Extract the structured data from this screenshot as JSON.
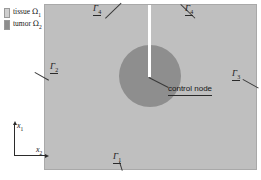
{
  "figure": {
    "colors": {
      "tissue_fill": "#bfbfbf",
      "tumor_fill": "#8e8e8e",
      "probe": "#ffffff",
      "line": "#2a2a2a",
      "background": "#ffffff"
    }
  },
  "legend": {
    "items": [
      {
        "label": "tissue",
        "symbol": "Ω",
        "subscript": "1",
        "swatch_color": "#cfcfcf",
        "name": "tissue"
      },
      {
        "label": "tumor",
        "symbol": "Ω",
        "subscript": "2",
        "swatch_color": "#8e8e8e",
        "name": "tumor"
      }
    ]
  },
  "boundaries": [
    {
      "id": "gamma-1",
      "symbol": "Γ",
      "subscript": "1",
      "position": "bottom-center"
    },
    {
      "id": "gamma-2",
      "symbol": "Γ",
      "subscript": "2",
      "position": "left"
    },
    {
      "id": "gamma-3",
      "symbol": "Γ",
      "subscript": "3",
      "position": "right"
    },
    {
      "id": "gamma-4-left",
      "symbol": "Γ",
      "subscript": "4",
      "position": "top-left"
    },
    {
      "id": "gamma-4-right",
      "symbol": "Γ",
      "subscript": "4",
      "position": "top-right"
    }
  ],
  "annotations": {
    "control_node": "control node"
  },
  "axes": {
    "vertical": {
      "symbol": "x",
      "subscript": "1"
    },
    "horizontal": {
      "symbol": "x",
      "subscript": "2"
    }
  }
}
